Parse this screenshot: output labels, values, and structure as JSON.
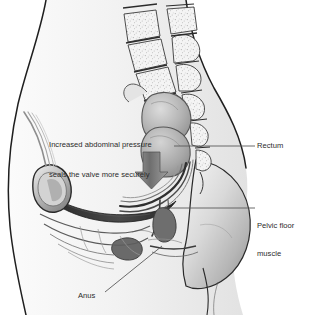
{
  "figure": {
    "type": "medical-illustration",
    "width": 313,
    "height": 315,
    "style": "grayscale line and tone drawing",
    "background_color": "#ffffff",
    "ink_color": "#2b2b2b"
  },
  "callout": {
    "line1": "Increased abdominal pressure",
    "line2": "seals the valve more securely",
    "full_text": "Increased abdominal pressure seals the valve more securely"
  },
  "labels": {
    "rectum": "Rectum",
    "pelvic_floor_line1": "Pelvic floor",
    "pelvic_floor_line2": "muscle",
    "pelvic_floor_full": "Pelvic floor muscle",
    "anus": "Anus"
  },
  "anatomy": {
    "parts": [
      "vertebral-column",
      "sacrum",
      "coccyx",
      "rectum",
      "anal-canal",
      "anal-sphincter",
      "pelvic-floor-muscle",
      "pubic-bone",
      "bladder",
      "buttock",
      "abdominal-wall"
    ]
  },
  "colors": {
    "outline": "#1f1f1f",
    "tone_light": "#ededed",
    "tone_mid": "#c9c9c9",
    "tone_dark": "#8a8a8a",
    "muscle_dark": "#3a3a3a",
    "arrow_fill": "#7e7e7e",
    "leader_line": "#5a5a5a"
  },
  "arrow": {
    "name": "abdominal-pressure-arrow",
    "direction": "down"
  }
}
